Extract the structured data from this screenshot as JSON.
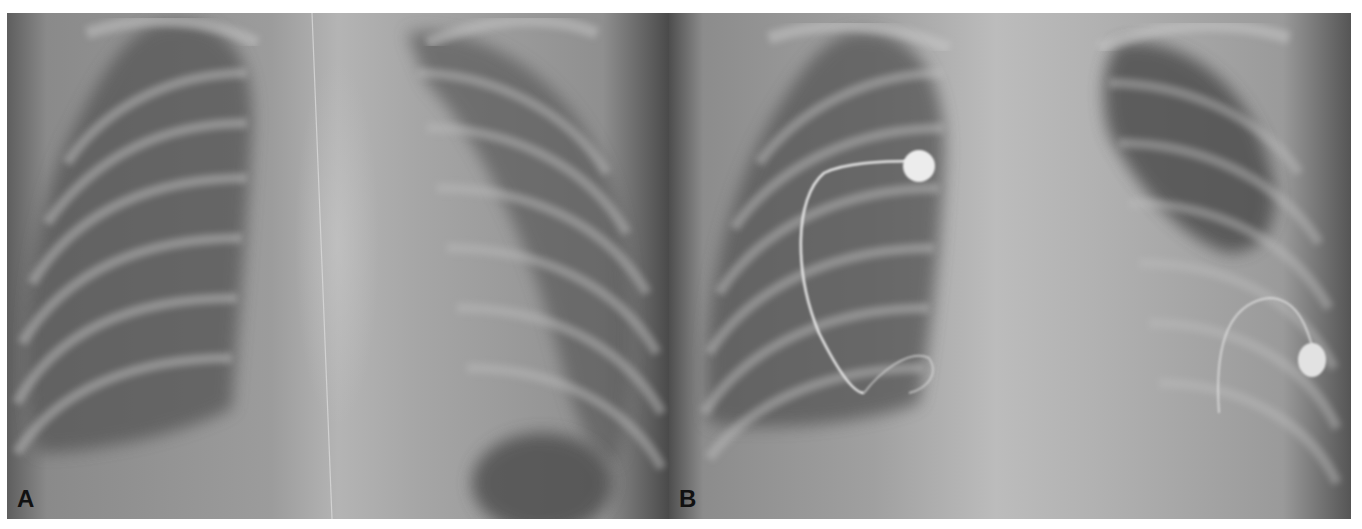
{
  "figure": {
    "panels": [
      {
        "id": "A",
        "label": "A",
        "description": "Frontal chest radiograph"
      },
      {
        "id": "B",
        "label": "B",
        "description": "Frontal chest radiograph with pacemaker leads and generator devices"
      }
    ],
    "colors": {
      "background": "#ffffff",
      "label_text": "#111111",
      "film_mid_gray": "#9c9c9c",
      "lung_dark": "#4a4a4a",
      "device_bright": "#e6e6e6"
    }
  }
}
